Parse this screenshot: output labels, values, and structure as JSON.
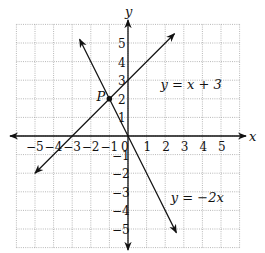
{
  "chart_data": {
    "type": "line",
    "title": "",
    "xlabel": "x",
    "ylabel": "y",
    "xlim": [
      -6,
      6
    ],
    "ylim": [
      -6,
      6
    ],
    "grid": true,
    "x_ticks": [
      "−5",
      "−4",
      "−3",
      "−2",
      "−1",
      "0",
      "1",
      "2",
      "3",
      "4",
      "5"
    ],
    "y_ticks": [
      "5",
      "4",
      "3",
      "2",
      "1",
      "−1",
      "−2",
      "−3",
      "−4",
      "−5"
    ],
    "series": [
      {
        "name": "y = x + 3",
        "equation": "y = x + 3",
        "x": [
          -5,
          5
        ],
        "y": [
          -2,
          8
        ],
        "drawn_from": [
          -5,
          -2
        ],
        "drawn_to": [
          2.5,
          5.5
        ]
      },
      {
        "name": "y = −2x",
        "equation": "y = −2x",
        "x": [
          -2.6,
          2.6
        ],
        "y": [
          5.2,
          -5.2
        ],
        "drawn_from": [
          -2.6,
          5.2
        ],
        "drawn_to": [
          2.6,
          -5.2
        ]
      }
    ],
    "annotations": [
      {
        "label": "P",
        "point": [
          -1,
          2
        ],
        "note": "intersection point"
      },
      {
        "label": "y = x + 3",
        "position": [
          1.8,
          2.8
        ]
      },
      {
        "label": "y = −2x",
        "position": [
          2.3,
          -3.5
        ]
      }
    ]
  },
  "labels": {
    "x_axis": "x",
    "y_axis": "y",
    "point": "P",
    "eq1": "y = x + 3",
    "eq2": "y = −2x"
  }
}
